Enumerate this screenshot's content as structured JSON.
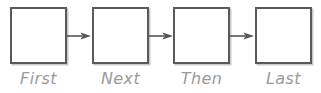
{
  "diagram": {
    "type": "linear-flow",
    "orientation": "horizontal",
    "title": "",
    "node_count": 4,
    "connector_count": 3,
    "colors": {
      "background": "#ffffff",
      "node_border": "#5a5a5a",
      "node_fill": "#ffffff",
      "node_shadow": "#c9c9c9",
      "label_text": "#9a9a9a",
      "connector": "#555555"
    },
    "nodes": [
      {
        "id": "node-1",
        "label": "First",
        "content": ""
      },
      {
        "id": "node-2",
        "label": "Next",
        "content": ""
      },
      {
        "id": "node-3",
        "label": "Then",
        "content": ""
      },
      {
        "id": "node-4",
        "label": "Last",
        "content": ""
      }
    ],
    "connectors": [
      {
        "id": "connector-1",
        "from": "node-1",
        "to": "node-2",
        "style": "arrow-right",
        "label": ""
      },
      {
        "id": "connector-2",
        "from": "node-2",
        "to": "node-3",
        "style": "arrow-right",
        "label": ""
      },
      {
        "id": "connector-3",
        "from": "node-3",
        "to": "node-4",
        "style": "arrow-right",
        "label": ""
      }
    ]
  }
}
